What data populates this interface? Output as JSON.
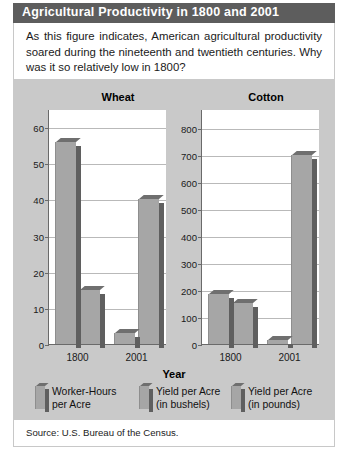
{
  "header": {
    "title": "Agricultural Productivity in 1800 and 2001"
  },
  "caption": {
    "text": "As this figure indicates, American agricultural productivity soared during the nineteenth and twentieth centuries. Why was it so relatively low in 1800?"
  },
  "source": {
    "text": "Source: U.S. Bureau of the Census."
  },
  "legend": {
    "items": [
      {
        "label_line1": "Worker-Hours",
        "label_line2": "per Acre"
      },
      {
        "label_line1": "Yield per Acre",
        "label_line2": "(in bushels)"
      },
      {
        "label_line1": "Yield per Acre",
        "label_line2": "(in pounds)"
      }
    ]
  },
  "axis": {
    "x_title": "Year"
  },
  "colors": {
    "header_bar": "#5d5d5d",
    "panel_background": "#c9c9c9",
    "plot_background": "#ffffff",
    "bar_face": "#a6a6a6",
    "bar_side": "#5f5f5f",
    "gridline": "#b9b9b9"
  },
  "chart_data": [
    {
      "type": "bar",
      "title": "Wheat",
      "xlabel": "Year",
      "ylabel": "",
      "categories": [
        "1800",
        "2001"
      ],
      "yticks": [
        0,
        10,
        20,
        30,
        40,
        50,
        60
      ],
      "ylim": [
        0,
        65
      ],
      "grid": true,
      "legend_position": "bottom",
      "series": [
        {
          "name": "Worker-Hours per Acre",
          "values": [
            56,
            3
          ]
        },
        {
          "name": "Yield per Acre (in bushels)",
          "values": [
            15,
            40
          ]
        }
      ]
    },
    {
      "type": "bar",
      "title": "Cotton",
      "xlabel": "Year",
      "ylabel": "",
      "categories": [
        "1800",
        "2001"
      ],
      "yticks": [
        0,
        100,
        200,
        300,
        400,
        500,
        600,
        700,
        800
      ],
      "ylim": [
        0,
        870
      ],
      "grid": true,
      "legend_position": "bottom",
      "series": [
        {
          "name": "Worker-Hours per Acre",
          "values": [
            185,
            15
          ]
        },
        {
          "name": "Yield per Acre (in pounds)",
          "values": [
            150,
            700
          ]
        }
      ]
    }
  ]
}
